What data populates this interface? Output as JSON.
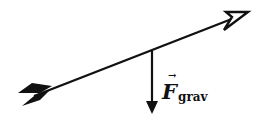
{
  "diagram": {
    "colors": {
      "ink": "#111111",
      "background": "#ffffff"
    },
    "arrow": {
      "tail": [
        50,
        90
      ],
      "head": [
        247,
        13
      ]
    },
    "force": {
      "label_main": "F",
      "label_sub": "grav",
      "vector_mark": "→",
      "origin": [
        152,
        52
      ],
      "end": [
        152,
        113
      ]
    }
  }
}
